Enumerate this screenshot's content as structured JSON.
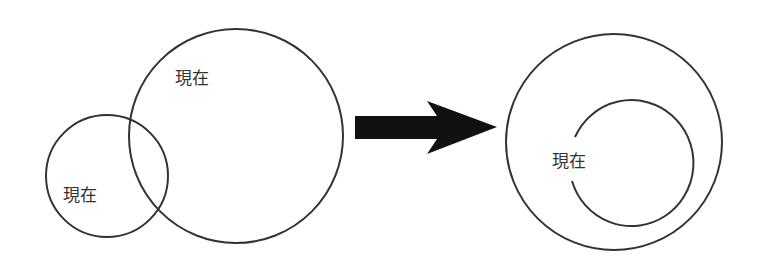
{
  "diagram": {
    "before": {
      "small_circle_label": "現在",
      "large_circle_label": "現在"
    },
    "arrow": {
      "direction": "right",
      "color": "#111111"
    },
    "after": {
      "inner_arc_label": "現在"
    },
    "stroke_color": "#333333"
  }
}
